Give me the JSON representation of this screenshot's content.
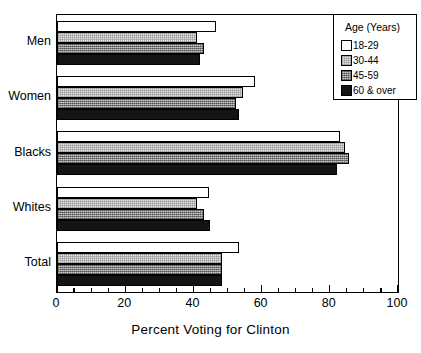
{
  "chart_data": {
    "type": "bar",
    "orientation": "horizontal",
    "title": "",
    "xlabel": "Percent Voting for Clinton",
    "ylabel": "",
    "xlim": [
      0,
      100
    ],
    "xticks": [
      0,
      20,
      40,
      60,
      80,
      100
    ],
    "xtick_labels": [
      "0",
      "20",
      "40",
      "60",
      "80",
      "100"
    ],
    "minor_tick_step": 5,
    "grid": false,
    "legend_position": "top-right",
    "legend_title": "Age  (Years)",
    "categories": [
      "Men",
      "Women",
      "Blacks",
      "Whites",
      "Total"
    ],
    "series": [
      {
        "name": "18-29",
        "fill": "white",
        "color": "#ffffff",
        "values": [
          46.5,
          58.0,
          83.0,
          44.5,
          53.5
        ]
      },
      {
        "name": "30-44",
        "fill": "light-stipple",
        "color": "#e6e6e6",
        "values": [
          41.0,
          54.5,
          84.5,
          41.0,
          48.5
        ]
      },
      {
        "name": "45-59",
        "fill": "gray-hatch",
        "color": "#9a9a9a",
        "values": [
          43.0,
          52.5,
          85.5,
          43.0,
          48.5
        ]
      },
      {
        "name": "60 & over",
        "fill": "black",
        "color": "#141414",
        "values": [
          42.0,
          53.5,
          82.0,
          45.0,
          48.5
        ]
      }
    ]
  },
  "axis": {
    "x_title": "Percent Voting for Clinton"
  },
  "legend": {
    "title": "Age  (Years)",
    "entries": [
      "18-29",
      "30-44",
      "45-59",
      "60 & over"
    ]
  }
}
